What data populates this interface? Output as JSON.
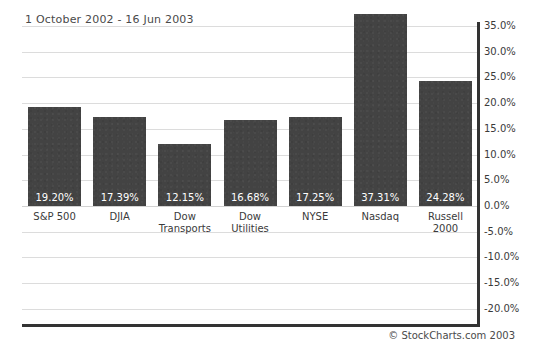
{
  "chart_data": {
    "type": "bar",
    "title": "1 October 2002 - 16 Jun 2003",
    "xlabel": "",
    "ylabel": "",
    "ylim": [
      -20.0,
      35.0
    ],
    "grid": true,
    "legend": false,
    "categories": [
      "S&P 500",
      "DJIA",
      "Dow Transports",
      "Dow Utilities",
      "NYSE",
      "Nasdaq",
      "Russell 2000"
    ],
    "values": [
      19.2,
      17.39,
      12.15,
      16.68,
      17.25,
      37.31,
      24.28
    ],
    "value_labels": [
      "19.20%",
      "17.39%",
      "12.15%",
      "16.68%",
      "17.25%",
      "37.31%",
      "24.28%"
    ],
    "category_lines": [
      [
        "S&P 500"
      ],
      [
        "DJIA"
      ],
      [
        "Dow",
        "Transports"
      ],
      [
        "Dow",
        "Utilities"
      ],
      [
        "NYSE"
      ],
      [
        "Nasdaq"
      ],
      [
        "Russell",
        "2000"
      ]
    ],
    "yticks": [
      35.0,
      30.0,
      25.0,
      20.0,
      15.0,
      10.0,
      5.0,
      0.0,
      -5.0,
      -10.0,
      -15.0,
      -20.0
    ],
    "ytick_labels": [
      "35.0%",
      "30.0%",
      "25.0%",
      "20.0%",
      "15.0%",
      "10.0%",
      "5.0%",
      "0.0%",
      "-5.0%",
      "-10.0%",
      "-15.0%",
      "-20.0%"
    ],
    "bar_color": "#434343",
    "grid_color": "#dcdcdc",
    "axis_color": "#333333",
    "text_color": "#3a3a3a"
  },
  "footer": {
    "credit": "© StockCharts.com 2003"
  }
}
